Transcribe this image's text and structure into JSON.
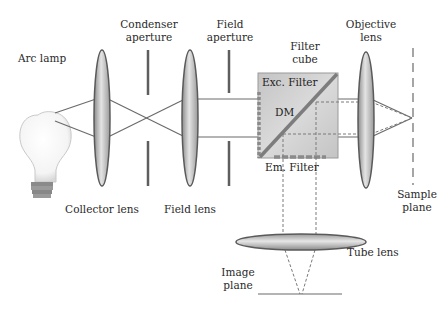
{
  "labels": {
    "arc_lamp": "Arc lamp",
    "condenser_aperture_l1": "Condenser",
    "condenser_aperture_l2": "aperture",
    "field_aperture_l1": "Field",
    "field_aperture_l2": "aperture",
    "filter_cube_l1": "Filter",
    "filter_cube_l2": "cube",
    "objective_lens_l1": "Objective",
    "objective_lens_l2": "lens",
    "exc_filter": "Exc. Filter",
    "dm": "DM",
    "em_filter": "Em. Filter",
    "collector_lens": "Collector lens",
    "field_lens": "Field lens",
    "sample_plane_l1": "Sample",
    "sample_plane_l2": "plane",
    "tube_lens": "Tube lens",
    "image_plane_l1": "Image",
    "image_plane_l2": "plane"
  },
  "colors": {
    "line": "#6b6b6b",
    "dashed_line": "#7a7a7a",
    "lens_edge": "#5a5a5a",
    "lens_fill_light": "#e8e8e8",
    "lens_fill_dark": "#8c8c8c",
    "cube_fill": "#c9c9c9",
    "dichroic": "#7d7d7d",
    "filter_dots": "#8a8a8a",
    "aperture": "#5e5e5e"
  }
}
